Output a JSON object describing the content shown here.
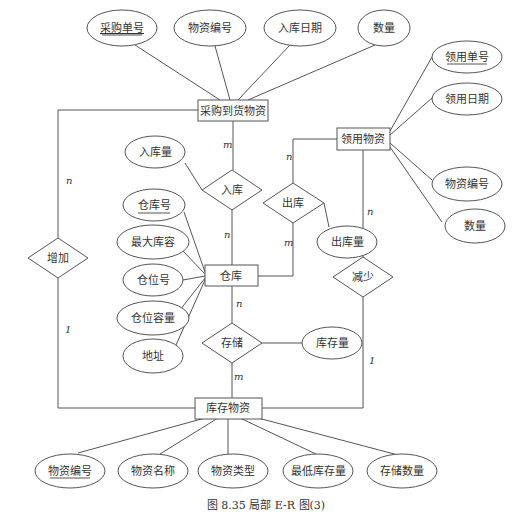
{
  "caption": "图 8.35   局部 E-R 图(3)",
  "entities": {
    "purchase": "采购到货物资",
    "requisition": "领用物资",
    "warehouse": "仓库",
    "inventory": "库存物资"
  },
  "relationships": {
    "inbound": "入库",
    "outbound": "出库",
    "increase": "增加",
    "decrease": "减少",
    "storage": "存储"
  },
  "attributes": {
    "purchase": [
      "采购单号",
      "物资编号",
      "入库日期",
      "数量"
    ],
    "requisition": [
      "领用单号",
      "领用日期",
      "物资编号",
      "数量"
    ],
    "warehouse": [
      "仓库号",
      "最大库容",
      "仓位号",
      "仓位容量",
      "地址"
    ],
    "inventory": [
      "物资编号",
      "物资名称",
      "物资类型",
      "最低库存量",
      "存储数量"
    ],
    "inbound": "入库量",
    "outbound": "出库量",
    "storage": "库存量"
  },
  "cardinalities": {
    "purchase_inbound": "m",
    "inbound_warehouse": "n",
    "requisition_outbound": "n",
    "outbound_warehouse": "m",
    "purchase_increase": "n",
    "increase_inventory": "1",
    "requisition_decrease": "n",
    "decrease_inventory": "1",
    "warehouse_storage": "n",
    "storage_inventory": "m"
  }
}
